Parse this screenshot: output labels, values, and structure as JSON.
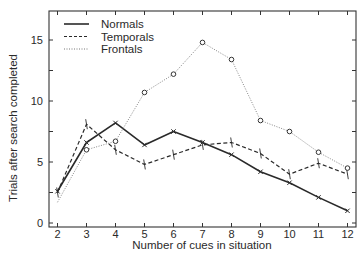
{
  "chart_data": {
    "type": "line",
    "title": "",
    "xlabel": "Number of cues in situation",
    "ylabel": "Trials after search completed",
    "x": [
      2,
      3,
      4,
      5,
      6,
      7,
      8,
      9,
      10,
      11,
      12
    ],
    "xlim": [
      1.7,
      12.3
    ],
    "ylim": [
      0,
      17.5
    ],
    "yticks": [
      0,
      5,
      10,
      15
    ],
    "xticks": [
      2,
      3,
      4,
      5,
      6,
      7,
      8,
      9,
      10,
      11,
      12
    ],
    "grid": false,
    "legend_position": "upper-left",
    "series": [
      {
        "name": "Normals",
        "style": "solid",
        "marker": "x",
        "color": "#2a2a2a",
        "values": [
          2.6,
          6.6,
          8.2,
          6.4,
          7.5,
          6.6,
          5.6,
          4.2,
          3.3,
          2.1,
          1.0
        ]
      },
      {
        "name": "Temporals",
        "style": "dashed",
        "marker": "tick",
        "color": "#2a2a2a",
        "values": [
          2.5,
          8.1,
          6.0,
          4.8,
          5.6,
          6.4,
          6.6,
          5.7,
          4.0,
          4.9,
          4.0
        ]
      },
      {
        "name": "Frontals",
        "style": "dotted",
        "marker": "circle",
        "color": "#555555",
        "values": [
          1.7,
          6.0,
          6.7,
          10.7,
          12.2,
          14.8,
          13.4,
          8.4,
          7.5,
          5.8,
          4.5
        ]
      }
    ]
  },
  "legend": {
    "items": [
      {
        "label": "Normals"
      },
      {
        "label": "Temporals"
      },
      {
        "label": "Frontals"
      }
    ]
  },
  "axes": {
    "xlabel": "Number of cues in situation",
    "ylabel": "Trials after search completed",
    "xtick_labels": [
      "2",
      "3",
      "4",
      "5",
      "6",
      "7",
      "8",
      "9",
      "10",
      "11",
      "12"
    ],
    "ytick_labels": [
      "0",
      "5",
      "10",
      "15"
    ]
  }
}
